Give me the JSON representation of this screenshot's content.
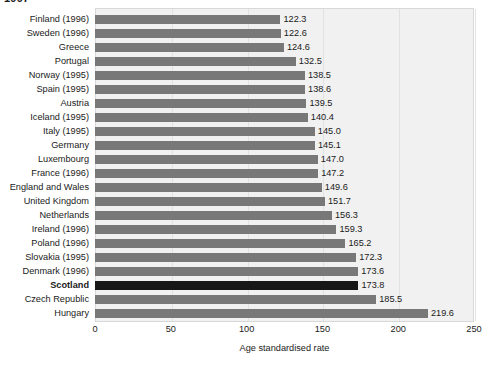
{
  "figure": {
    "year_caption": "1997",
    "background_color": "#ffffff",
    "panel_color": "#f1f1f1",
    "bar_color": "#787878",
    "highlight_bar_color": "#171717",
    "gridline_color": "#e2e2e2"
  },
  "axis": {
    "x_title": "Age standardised rate",
    "x_ticks": [
      "0",
      "50",
      "100",
      "150",
      "200",
      "250"
    ]
  },
  "chart_data": {
    "type": "bar",
    "orientation": "horizontal",
    "title": "1997",
    "xlabel": "Age standardised rate",
    "ylabel": "",
    "xlim": [
      0,
      250
    ],
    "grid": true,
    "legend": "none",
    "highlight_category": "Scotland",
    "categories": [
      "Finland (1996)",
      "Sweden (1996)",
      "Greece",
      "Portugal",
      "Norway (1995)",
      "Spain (1995)",
      "Austria",
      "Iceland (1995)",
      "Italy (1995)",
      "Germany",
      "Luxembourg",
      "France (1996)",
      "England and Wales",
      "United Kingdom",
      "Netherlands",
      "Ireland (1996)",
      "Poland (1996)",
      "Slovakia (1995)",
      "Denmark (1996)",
      "Scotland",
      "Czech Republic",
      "Hungary"
    ],
    "values": [
      122.3,
      122.6,
      124.6,
      132.5,
      138.5,
      138.6,
      139.5,
      140.4,
      145.0,
      145.1,
      147.0,
      147.2,
      149.6,
      151.7,
      156.3,
      159.3,
      165.2,
      172.3,
      173.6,
      173.8,
      185.5,
      219.6
    ],
    "value_labels": [
      "122.3",
      "122.6",
      "124.6",
      "132.5",
      "138.5",
      "138.6",
      "139.5",
      "140.4",
      "145.0",
      "145.1",
      "147.0",
      "147.2",
      "149.6",
      "151.7",
      "156.3",
      "159.3",
      "165.2",
      "172.3",
      "173.6",
      "173.8",
      "185.5",
      "219.6"
    ]
  }
}
